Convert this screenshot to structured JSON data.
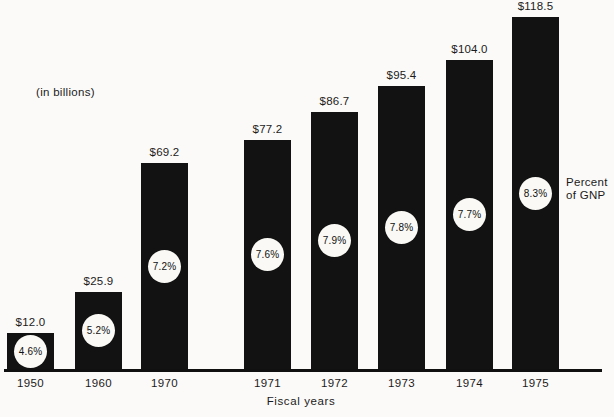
{
  "figure": {
    "in_billions_label": "(in billions)",
    "percent_gnp_label": "Percent\nof GNP",
    "xlabel": "Fiscal years"
  },
  "chart_data": {
    "type": "bar",
    "title": "",
    "xlabel": "Fiscal years",
    "categories": [
      "1950",
      "1960",
      "1970",
      "1971",
      "1972",
      "1973",
      "1974",
      "1975"
    ],
    "series": [
      {
        "name": "Outlays (in billions)",
        "values": [
          12.0,
          25.9,
          69.2,
          77.2,
          86.7,
          95.4,
          104.0,
          118.5
        ],
        "labels": [
          "$12.0",
          "$25.9",
          "$69.2",
          "$77.2",
          "$86.7",
          "$95.4",
          "$104.0",
          "$118.5"
        ]
      },
      {
        "name": "Percent of GNP",
        "values": [
          4.6,
          5.2,
          7.2,
          7.6,
          7.9,
          7.8,
          7.7,
          8.3
        ],
        "labels": [
          "4.6%",
          "5.2%",
          "7.2%",
          "7.6%",
          "7.9%",
          "7.8%",
          "7.7%",
          "8.3%"
        ]
      }
    ],
    "annotations": [
      "(in billions)",
      "Percent\nof GNP"
    ],
    "ylim": [
      0,
      125
    ],
    "grid": false,
    "legend": "none",
    "bar_color": "#121212",
    "circle_color": "#faf9f5",
    "background_color": "#fbfaf8",
    "text_color": "#1b1b1b"
  }
}
